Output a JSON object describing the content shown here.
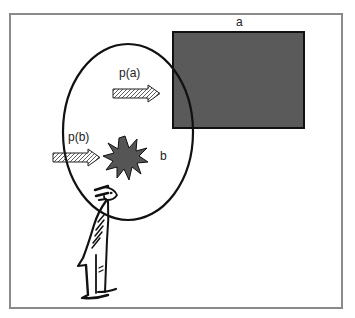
{
  "diagram": {
    "labels": {
      "rect_label": "a",
      "burst_label": "b",
      "arrow_a_label": "p(a)",
      "arrow_b_label": "p(b)"
    },
    "colors": {
      "frame": "#8a8a8a",
      "rect_fill": "#5a5a5a",
      "burst_fill": "#555555",
      "stroke": "#111111"
    },
    "elements": [
      "rectangle a (dark gray, top right)",
      "ellipse (perceptual field)",
      "arrow p(a) pointing to rectangle",
      "arrow p(b) pointing to starburst",
      "starburst b",
      "standing person figure (observer)"
    ]
  }
}
